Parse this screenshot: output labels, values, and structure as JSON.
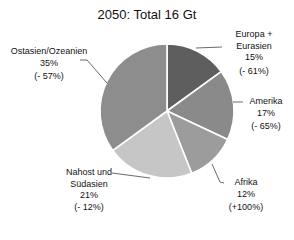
{
  "chart_data": {
    "type": "pie",
    "title": "2050: Total 16 Gt",
    "categories": [
      "Europa + Eurasien",
      "Amerika",
      "Afrika",
      "Nahost und Südasien",
      "Ostasien/Ozeanien"
    ],
    "values": [
      15,
      17,
      12,
      21,
      35
    ],
    "unit": "%",
    "change_labels": [
      "(- 61%)",
      "(- 65%)",
      "(+100%)",
      "(- 12%)",
      "(- 57%)"
    ],
    "colors": [
      "#5e5e5e",
      "#8a8a8a",
      "#9c9c9c",
      "#c6c6c6",
      "#8d8d8d"
    ],
    "legend": "none",
    "data_labels": "outside with leader lines"
  },
  "labels": {
    "europa": {
      "line1": "Europa +",
      "line2": "Eurasien",
      "pct": "15%",
      "chg": "(- 61%)"
    },
    "amerika": {
      "line1": "Amerika",
      "pct": "17%",
      "chg": "(- 65%)"
    },
    "afrika": {
      "line1": "Afrika",
      "pct": "12%",
      "chg": "(+100%)"
    },
    "nahost": {
      "line1": "Nahost und",
      "line2": "Südasien",
      "pct": "21%",
      "chg": "(- 12%)"
    },
    "ostasien": {
      "line1": "Ostasien/Ozeanien",
      "pct": "35%",
      "chg": "(- 57%)"
    }
  }
}
